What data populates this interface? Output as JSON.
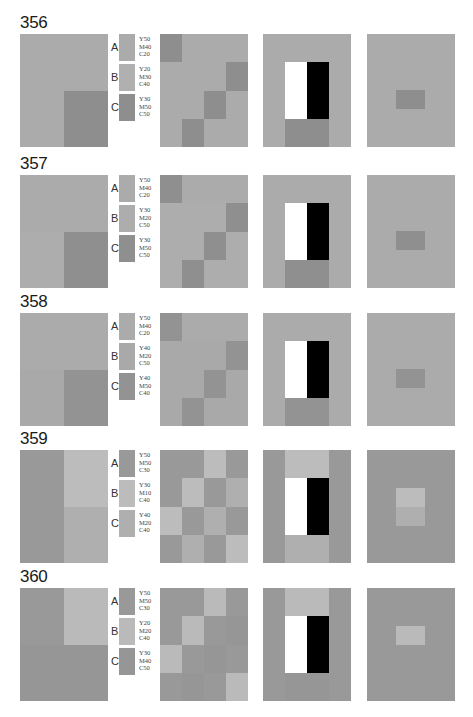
{
  "page": {
    "corner_mark": "—"
  },
  "rows": [
    {
      "number": "356",
      "swatches": [
        {
          "letter": "A",
          "y": "Y50",
          "m": "M40",
          "c": "C20",
          "color": "#ababab"
        },
        {
          "letter": "B",
          "y": "Y20",
          "m": "M30",
          "c": "C40",
          "color": "#b0b0b0"
        },
        {
          "letter": "C",
          "y": "Y30",
          "m": "M50",
          "c": "C50",
          "color": "#8e8e8e"
        }
      ],
      "colors": {
        "A": "#ababab",
        "B": "#b0b0b0",
        "C": "#8e8e8e"
      },
      "left_layout": "TL:A,TR:A,BL:B,BR:C",
      "grid": [
        [
          "C",
          "A",
          "A",
          "A"
        ],
        [
          "A",
          "A",
          "A",
          "C"
        ],
        [
          "A",
          "A",
          "C",
          "A"
        ],
        [
          "A",
          "C",
          "A",
          "A"
        ]
      ],
      "rect_bg": "A",
      "rect_bottom": "C",
      "rect_top": "A",
      "rect_sides": "A",
      "small_bg": "A",
      "small_center_top": "C",
      "small_center_bottom": "C"
    },
    {
      "number": "357",
      "swatches": [
        {
          "letter": "A",
          "y": "Y50",
          "m": "M40",
          "c": "C20",
          "color": "#ababab"
        },
        {
          "letter": "B",
          "y": "Y30",
          "m": "M20",
          "c": "C50",
          "color": "#adadad"
        },
        {
          "letter": "C",
          "y": "Y30",
          "m": "M50",
          "c": "C50",
          "color": "#8f8f8f"
        }
      ],
      "colors": {
        "A": "#ababab",
        "B": "#adadad",
        "C": "#8f8f8f"
      },
      "grid": [
        [
          "C",
          "A",
          "A",
          "A"
        ],
        [
          "B",
          "B",
          "B",
          "C"
        ],
        [
          "B",
          "B",
          "C",
          "B"
        ],
        [
          "B",
          "C",
          "B",
          "B"
        ]
      ],
      "rect_bg": "A",
      "rect_bottom": "C",
      "rect_top": "A",
      "rect_sides": "A",
      "small_bg": "A",
      "small_center_top": "C",
      "small_center_bottom": "C"
    },
    {
      "number": "358",
      "swatches": [
        {
          "letter": "A",
          "y": "Y50",
          "m": "M40",
          "c": "C20",
          "color": "#ababab"
        },
        {
          "letter": "B",
          "y": "Y40",
          "m": "M20",
          "c": "C50",
          "color": "#a9a9a9"
        },
        {
          "letter": "C",
          "y": "Y40",
          "m": "M50",
          "c": "C40",
          "color": "#939393"
        }
      ],
      "colors": {
        "A": "#ababab",
        "B": "#a9a9a9",
        "C": "#939393"
      },
      "grid": [
        [
          "C",
          "A",
          "A",
          "A"
        ],
        [
          "B",
          "B",
          "B",
          "C"
        ],
        [
          "B",
          "B",
          "C",
          "B"
        ],
        [
          "B",
          "C",
          "B",
          "B"
        ]
      ],
      "rect_bg": "A",
      "rect_bottom": "C",
      "rect_top": "A",
      "rect_sides": "A",
      "small_bg": "A",
      "small_center_top": "C",
      "small_center_bottom": "C"
    },
    {
      "number": "359",
      "swatches": [
        {
          "letter": "A",
          "y": "Y50",
          "m": "M50",
          "c": "C30",
          "color": "#999999"
        },
        {
          "letter": "B",
          "y": "Y30",
          "m": "M10",
          "c": "C40",
          "color": "#bcbcbc"
        },
        {
          "letter": "C",
          "y": "Y40",
          "m": "M20",
          "c": "C40",
          "color": "#afafaf"
        }
      ],
      "colors": {
        "A": "#999999",
        "B": "#bcbcbc",
        "C": "#afafaf"
      },
      "grid": [
        [
          "A",
          "A",
          "B",
          "A"
        ],
        [
          "A",
          "B",
          "A",
          "C"
        ],
        [
          "B",
          "A",
          "C",
          "A"
        ],
        [
          "A",
          "C",
          "A",
          "B"
        ]
      ],
      "rect_bg": "A",
      "rect_bottom": "C",
      "rect_top": "B",
      "rect_sides": "A",
      "small_bg": "A",
      "small_center_top": "B",
      "small_center_bottom": "C"
    },
    {
      "number": "360",
      "swatches": [
        {
          "letter": "A",
          "y": "Y50",
          "m": "M50",
          "c": "C30",
          "color": "#999999"
        },
        {
          "letter": "B",
          "y": "Y20",
          "m": "M20",
          "c": "C40",
          "color": "#bababa"
        },
        {
          "letter": "C",
          "y": "Y30",
          "m": "M40",
          "c": "C50",
          "color": "#969696"
        }
      ],
      "colors": {
        "A": "#999999",
        "B": "#bababa",
        "C": "#969696"
      },
      "grid": [
        [
          "A",
          "A",
          "B",
          "A"
        ],
        [
          "A",
          "B",
          "A",
          "C"
        ],
        [
          "B",
          "A",
          "C",
          "A"
        ],
        [
          "A",
          "C",
          "A",
          "B"
        ]
      ],
      "rect_bg": "A",
      "rect_bottom": "C",
      "rect_top": "B",
      "rect_sides": "A",
      "small_bg": "A",
      "small_center_top": "B",
      "small_center_bottom": "B"
    }
  ],
  "constants": {
    "white": "#ffffff",
    "black": "#000000"
  }
}
